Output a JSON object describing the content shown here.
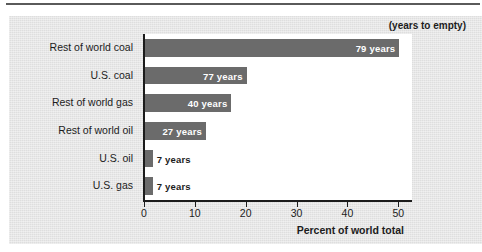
{
  "chart_data": {
    "type": "bar",
    "orientation": "horizontal",
    "title": "",
    "note": "(years to empty)",
    "xlabel": "Percent of world total",
    "ylabel": "",
    "xlim": [
      0,
      52.5
    ],
    "xticks": [
      0,
      10,
      20,
      30,
      40,
      50
    ],
    "grid": false,
    "legend": "none",
    "bar_color": "#6b6b6b",
    "plot_background": "#ffffff",
    "panel_background": "#e4e4e4",
    "categories": [
      "Rest of world coal",
      "U.S. coal",
      "Rest of world gas",
      "Rest of world oil",
      "U.S. oil",
      "U.S. gas"
    ],
    "values": [
      50,
      20,
      17,
      12,
      1.5,
      1.5
    ],
    "value_unit": "percent of world total",
    "data_labels": [
      "79 years",
      "77 years",
      "40 years",
      "27 years",
      "7 years",
      "7 years"
    ],
    "years_to_empty": [
      79,
      77,
      40,
      27,
      7,
      7
    ],
    "label_placement": [
      "inside",
      "inside",
      "inside",
      "inside",
      "outside",
      "outside"
    ]
  },
  "source": {
    "text": ""
  }
}
